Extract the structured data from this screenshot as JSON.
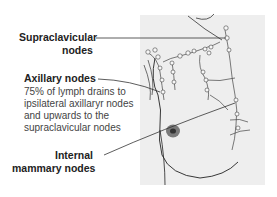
{
  "diagram": {
    "type": "anatomical-illustration",
    "labels": [
      {
        "id": "supraclavicular",
        "lines": [
          "Supraclavicular",
          "nodes"
        ]
      },
      {
        "id": "axillary",
        "title": "Axillary nodes",
        "description": [
          "75% of lymph drains to",
          "ipsilateral axillaryr nodes",
          "and upwards to the",
          "supraclavicular nodes"
        ]
      },
      {
        "id": "internal-mammary",
        "lines": [
          "Internal",
          "mammary nodes"
        ]
      }
    ]
  }
}
